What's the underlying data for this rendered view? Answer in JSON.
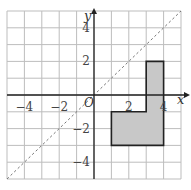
{
  "figure": {
    "type": "coordinate-grid",
    "x_range": [
      -5,
      5
    ],
    "y_range": [
      -5,
      5
    ],
    "grid_step": 1,
    "axes": {
      "x_label": "x",
      "y_label": "y",
      "origin_label": "O",
      "x_ticks": [
        {
          "value": -4,
          "label": "−4"
        },
        {
          "value": -2,
          "label": "−2"
        },
        {
          "value": 2,
          "label": "2"
        },
        {
          "value": 4,
          "label": "4"
        }
      ],
      "y_ticks": [
        {
          "value": 4,
          "label": "4"
        },
        {
          "value": 2,
          "label": "2"
        },
        {
          "value": -2,
          "label": "−2"
        },
        {
          "value": -4,
          "label": "−4"
        }
      ]
    },
    "shape": {
      "name": "L-shaped polygon",
      "vertices": [
        [
          1,
          -1
        ],
        [
          3,
          -1
        ],
        [
          3,
          2
        ],
        [
          4,
          2
        ],
        [
          4,
          -3
        ],
        [
          1,
          -3
        ]
      ],
      "fill": "#c8c8c8",
      "stroke": "#222222"
    },
    "mirror_line": {
      "equation": "y = x",
      "style": "dashed",
      "color": "#777777"
    },
    "colors": {
      "grid": "#bdbdbd",
      "axis": "#222222",
      "background": "#ffffff"
    }
  }
}
